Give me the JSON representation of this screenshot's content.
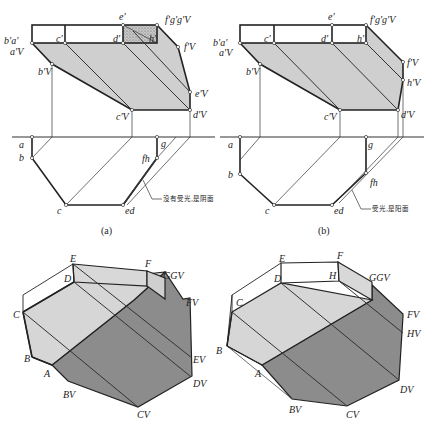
{
  "figure": {
    "panel_a": {
      "caption": "(a)",
      "front_view_labels": {
        "b_a": "b'a'",
        "a_v": "a'V",
        "c": "c'",
        "e": "e'",
        "d": "d'",
        "h": "h'",
        "fgg": "f'g'g'V",
        "f_v": "f'V",
        "b_v": "b'V",
        "e_v": "e'V",
        "c_v": "c'V",
        "d_v": "d'V"
      },
      "top_view_labels": {
        "a": "a",
        "b": "b",
        "c": "c",
        "ed": "ed",
        "fh": "fh",
        "g": "g"
      },
      "note": "没有受光,是阴面",
      "shaded_face": "d'e'f'h' (hatched, in shadow)"
    },
    "panel_b": {
      "caption": "(b)",
      "front_view_labels": {
        "b_a": "b'a'",
        "a_v": "a'V",
        "c": "c'",
        "e": "e'",
        "d": "d'",
        "h": "h'",
        "fgg": "f'g'g'V",
        "f_v": "f'V",
        "b_v": "b'V",
        "h_v": "h'V",
        "c_v": "c'V",
        "d_v": "d'V"
      },
      "top_view_labels": {
        "a": "a",
        "b": "b",
        "c": "c",
        "ed": "ed",
        "fh": "fh",
        "g": "g"
      },
      "note": "受光,是阳面"
    },
    "iso_left": {
      "labels": {
        "E": "E",
        "D": "D",
        "F": "F",
        "G": "GGV",
        "FV": "FV",
        "C": "C",
        "B": "B",
        "A": "A",
        "BV": "BV",
        "CV": "CV",
        "DV": "DV",
        "EV": "EV"
      }
    },
    "iso_right": {
      "labels": {
        "E": "E",
        "D": "D",
        "F": "F",
        "H": "H",
        "G": "GGV",
        "FV": "FV",
        "HV": "HV",
        "C": "C",
        "B": "B",
        "A": "A",
        "BV": "BV",
        "CV": "CV",
        "DV": "DV"
      }
    },
    "colors": {
      "light_face": "#d9d9d9",
      "mid_face": "#c8c8c8",
      "dark_shadow": "#8c8c8c",
      "hatch": "#b5b5b5",
      "line": "#222222"
    }
  }
}
